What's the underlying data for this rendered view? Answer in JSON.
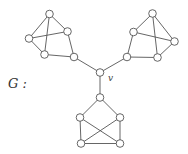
{
  "graph": {
    "name_label": "G :",
    "center_label": "v",
    "node_radius": 3.8,
    "nodes": [
      {
        "id": "v",
        "x": 100,
        "y": 72.5
      },
      {
        "id": "L1",
        "x": 49.5,
        "y": 14
      },
      {
        "id": "L2",
        "x": 67.5,
        "y": 31.5
      },
      {
        "id": "L3",
        "x": 29,
        "y": 38.5
      },
      {
        "id": "L4",
        "x": 44.5,
        "y": 54.5
      },
      {
        "id": "L5",
        "x": 74,
        "y": 57
      },
      {
        "id": "R1",
        "x": 152.5,
        "y": 13.5
      },
      {
        "id": "R2",
        "x": 133.5,
        "y": 32
      },
      {
        "id": "R3",
        "x": 174.5,
        "y": 41.5
      },
      {
        "id": "R4",
        "x": 127,
        "y": 57
      },
      {
        "id": "R5",
        "x": 157.5,
        "y": 57.5
      },
      {
        "id": "B1",
        "x": 100,
        "y": 97.5
      },
      {
        "id": "B2",
        "x": 80,
        "y": 117.5
      },
      {
        "id": "B3",
        "x": 120,
        "y": 117.5
      },
      {
        "id": "B4",
        "x": 81,
        "y": 143.5
      },
      {
        "id": "B5",
        "x": 120,
        "y": 143.5
      }
    ],
    "edges": [
      [
        "L1",
        "L2"
      ],
      [
        "L1",
        "L3"
      ],
      [
        "L1",
        "L4"
      ],
      [
        "L3",
        "L2"
      ],
      [
        "L3",
        "L4"
      ],
      [
        "L4",
        "L5"
      ],
      [
        "L2",
        "L5"
      ],
      [
        "L5",
        "v"
      ],
      [
        "R1",
        "R2"
      ],
      [
        "R1",
        "R3"
      ],
      [
        "R1",
        "R5"
      ],
      [
        "R2",
        "R3"
      ],
      [
        "R2",
        "R4"
      ],
      [
        "R4",
        "R5"
      ],
      [
        "R5",
        "R3"
      ],
      [
        "R4",
        "v"
      ],
      [
        "v",
        "B1"
      ],
      [
        "B1",
        "B2"
      ],
      [
        "B1",
        "B3"
      ],
      [
        "B2",
        "B4"
      ],
      [
        "B3",
        "B5"
      ],
      [
        "B4",
        "B5"
      ],
      [
        "B2",
        "B5"
      ],
      [
        "B3",
        "B4"
      ]
    ]
  }
}
